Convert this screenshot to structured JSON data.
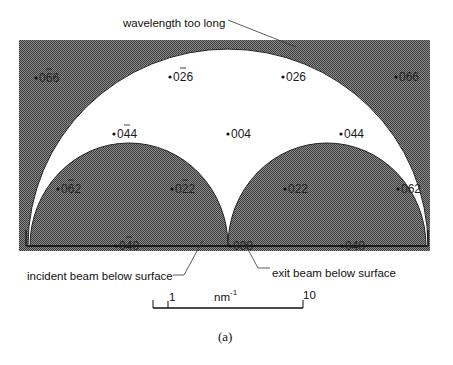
{
  "figure": {
    "caption": "(a)",
    "colors": {
      "shaded": "#5a5a5a",
      "shaded_light": "#8a8a8a",
      "background": "#ffffff",
      "line": "#111111"
    }
  },
  "annotations": {
    "top": "wavelength too long",
    "bottom_left": "incident beam below surface",
    "bottom_right": "exit beam below surface"
  },
  "reflections": {
    "row1": [
      {
        "text": "0",
        "bar": "6",
        "tail": "6",
        "x": 34,
        "y": 82,
        "shaded": true
      },
      {
        "text": "0",
        "bar": "2",
        "tail": "6",
        "x": 168,
        "y": 81,
        "shaded": false
      },
      {
        "text": "026",
        "x": 281,
        "y": 81,
        "shaded": false
      },
      {
        "text": "066",
        "x": 394,
        "y": 81,
        "shaded": true
      }
    ],
    "row2": [
      {
        "text": "0",
        "bar": "4",
        "tail": "4",
        "x": 112,
        "y": 138,
        "shaded": false
      },
      {
        "text": "004",
        "x": 226,
        "y": 138,
        "shaded": false
      },
      {
        "text": "044",
        "x": 339,
        "y": 138,
        "shaded": false
      }
    ],
    "row3": [
      {
        "text": "0",
        "bar": "6",
        "tail": "2",
        "x": 56,
        "y": 194,
        "shaded": true
      },
      {
        "text": "0",
        "bar": "2",
        "tail": "2",
        "x": 170,
        "y": 194,
        "shaded": true
      },
      {
        "text": "022",
        "x": 283,
        "y": 194,
        "shaded": true
      },
      {
        "text": "062",
        "x": 396,
        "y": 194,
        "shaded": true
      }
    ],
    "row4": [
      {
        "text": "0",
        "bar": "4",
        "tail": "0",
        "x": 114,
        "y": 250,
        "shaded": true
      },
      {
        "text": "000",
        "x": 228,
        "y": 250,
        "shaded": true
      },
      {
        "text": "040",
        "x": 340,
        "y": 250,
        "shaded": true
      }
    ]
  },
  "scale_bar": {
    "unit": "nm",
    "unit_exp": "-1",
    "tick_min": "1",
    "tick_max": "10"
  }
}
